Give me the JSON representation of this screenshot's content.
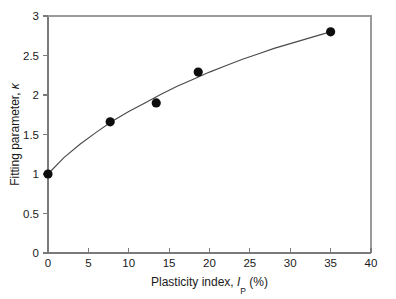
{
  "chart_data": {
    "type": "scatter",
    "title": "",
    "xlabel": "Plasticity index, Ip (%)",
    "xlabel_parts": {
      "prefix": "Plasticity index, ",
      "symbol": "I",
      "subscript": "P",
      "suffix": " (%)"
    },
    "ylabel": "Fitting parameter, κ",
    "ylabel_parts": {
      "prefix": "Fitting parameter, ",
      "symbol": "κ"
    },
    "xlim": [
      0,
      40
    ],
    "ylim": [
      0,
      3
    ],
    "xticks": [
      0,
      5,
      10,
      15,
      20,
      25,
      30,
      35,
      40
    ],
    "xtick_labels": [
      "0",
      "5",
      "10",
      "15",
      "20",
      "25",
      "30",
      "35",
      "40"
    ],
    "yticks": [
      0,
      0.5,
      1,
      1.5,
      2,
      2.5,
      3
    ],
    "ytick_labels": [
      "0",
      "0.5",
      "1",
      "1.5",
      "2",
      "2.5",
      "3"
    ],
    "grid": false,
    "legend": null,
    "series": [
      {
        "name": "Fitting parameter data",
        "marker": "filled-circle",
        "marker_color": "#0d0d0d",
        "points": [
          {
            "x": 0.0,
            "y": 1.0
          },
          {
            "x": 7.7,
            "y": 1.66
          },
          {
            "x": 13.4,
            "y": 1.9
          },
          {
            "x": 18.6,
            "y": 2.29
          },
          {
            "x": 35.0,
            "y": 2.8
          }
        ]
      },
      {
        "name": "Fitted curve",
        "type": "line",
        "line_color": "#4a4a4a",
        "points": [
          {
            "x": 0.0,
            "y": 1.0
          },
          {
            "x": 2.0,
            "y": 1.21
          },
          {
            "x": 4.0,
            "y": 1.38
          },
          {
            "x": 6.0,
            "y": 1.53
          },
          {
            "x": 8.0,
            "y": 1.67
          },
          {
            "x": 10.0,
            "y": 1.79
          },
          {
            "x": 12.0,
            "y": 1.9
          },
          {
            "x": 14.0,
            "y": 2.01
          },
          {
            "x": 16.0,
            "y": 2.11
          },
          {
            "x": 18.0,
            "y": 2.2
          },
          {
            "x": 20.0,
            "y": 2.29
          },
          {
            "x": 22.0,
            "y": 2.37
          },
          {
            "x": 24.0,
            "y": 2.45
          },
          {
            "x": 26.0,
            "y": 2.52
          },
          {
            "x": 28.0,
            "y": 2.59
          },
          {
            "x": 30.0,
            "y": 2.65
          },
          {
            "x": 32.0,
            "y": 2.71
          },
          {
            "x": 34.0,
            "y": 2.77
          },
          {
            "x": 35.0,
            "y": 2.8
          }
        ]
      }
    ],
    "colors": {
      "marker": "#0d0d0d",
      "curve": "#4a4a4a",
      "axis": "#7a7a7a",
      "frame": "#9a9a9a",
      "text": "#1a1a1a",
      "background": "#ffffff"
    },
    "geometry": {
      "plot_left": 48,
      "plot_right": 371,
      "plot_top": 16,
      "plot_bottom": 253,
      "marker_radius": 4.6
    }
  }
}
